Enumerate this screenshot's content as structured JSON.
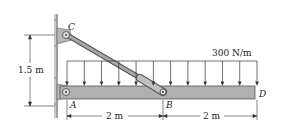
{
  "diagram": {
    "type": "beam-with-strut",
    "points": {
      "A": "A",
      "B": "B",
      "C": "C",
      "D": "D"
    },
    "load": {
      "label": "300 N/m",
      "type": "uniform-distributed",
      "arrow_count": 12
    },
    "dimensions": {
      "height_CA": "1.5 m",
      "span_AB": "2 m",
      "span_BD": "2 m"
    },
    "colors": {
      "beam": "#b0b0b0",
      "wall": "#c0c0c0",
      "ink": "#222222"
    }
  }
}
